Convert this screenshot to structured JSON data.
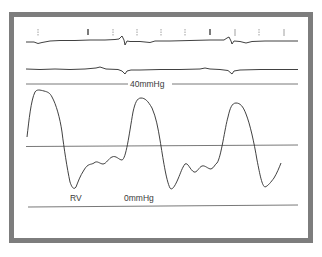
{
  "figure": {
    "frame_color": "#7d7d7d",
    "trace_color": "#2b2b2b",
    "scale_line_color": "#555555",
    "labels": {
      "top_scale": "40mmHg",
      "chamber": "RV",
      "bottom_scale": "0mmHg"
    },
    "traces": [
      {
        "name": "ecg-lead-1",
        "description": "ECG trace with tick markers above"
      },
      {
        "name": "ecg-lead-2",
        "description": "Second ECG lead"
      },
      {
        "name": "rv-pressure",
        "description": "Right ventricular pressure waveform, three beats"
      }
    ],
    "tick_marks_count": 11
  }
}
